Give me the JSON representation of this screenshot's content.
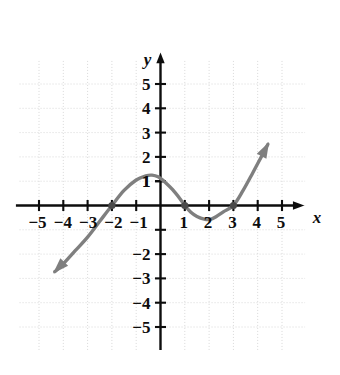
{
  "chart_data": {
    "type": "line",
    "title": "",
    "xlabel": "x",
    "ylabel": "y",
    "xlim": [
      -6,
      6
    ],
    "ylim": [
      -6,
      6
    ],
    "grid": true,
    "legend": null,
    "x_ticks": [
      -5,
      -4,
      -3,
      -2,
      -1,
      1,
      2,
      3,
      4,
      5
    ],
    "y_ticks": [
      5,
      4,
      3,
      2,
      1,
      -2,
      -3,
      -4,
      -5
    ],
    "x_tick_labels": [
      "−5",
      "−4",
      "−3",
      "−2",
      "−1",
      "1",
      "2",
      "3",
      "4",
      "5"
    ],
    "y_tick_labels": [
      "5",
      "4",
      "3",
      "2",
      "1",
      "−2",
      "−3",
      "−4",
      "−5"
    ],
    "curve_color": "#7f7f7f",
    "axis_color": "#0d0d0d",
    "grid_color": "#d8d8d8",
    "series": [
      {
        "name": "curve",
        "arrow_start": true,
        "arrow_end": true,
        "points": [
          [
            -4.35,
            -2.72
          ],
          [
            -4.0,
            -2.4
          ],
          [
            -3.5,
            -1.85
          ],
          [
            -3.0,
            -1.3
          ],
          [
            -2.5,
            -0.65
          ],
          [
            -2.0,
            0.0
          ],
          [
            -1.5,
            0.62
          ],
          [
            -1.0,
            1.05
          ],
          [
            -0.6,
            1.22
          ],
          [
            -0.35,
            1.25
          ],
          [
            -0.1,
            1.18
          ],
          [
            0.2,
            0.95
          ],
          [
            0.5,
            0.65
          ],
          [
            0.8,
            0.28
          ],
          [
            1.0,
            0.0
          ],
          [
            1.25,
            -0.28
          ],
          [
            1.5,
            -0.45
          ],
          [
            1.8,
            -0.56
          ],
          [
            2.05,
            -0.57
          ],
          [
            2.3,
            -0.45
          ],
          [
            2.6,
            -0.25
          ],
          [
            3.0,
            0.0
          ],
          [
            3.4,
            0.62
          ],
          [
            3.8,
            1.35
          ],
          [
            4.2,
            2.1
          ],
          [
            4.42,
            2.52
          ]
        ]
      }
    ],
    "marked_points": [
      {
        "x": -2,
        "y": 0,
        "label": "x-intercept"
      },
      {
        "x": 1,
        "y": 0,
        "label": "x-intercept"
      },
      {
        "x": 3,
        "y": 0,
        "label": "x-intercept"
      }
    ]
  }
}
